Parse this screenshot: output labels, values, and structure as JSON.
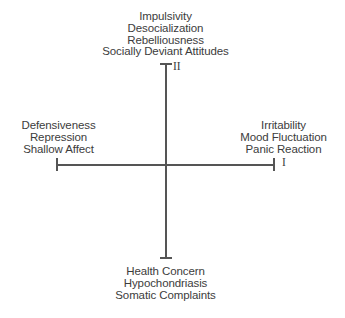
{
  "diagram": {
    "background_color": "#ffffff",
    "line_color": "#555555",
    "text_color": "#3c3c3c",
    "quadrant_labels": {
      "axis_i": "I",
      "axis_ii": "II"
    },
    "top": {
      "lines": [
        "Impulsivity",
        "Desocialization",
        "Rebelliousness",
        "Socially Deviant Attitudes"
      ]
    },
    "bottom": {
      "lines": [
        "Health Concern",
        "Hypochondriasis",
        "Somatic Complaints"
      ]
    },
    "left": {
      "lines": [
        "Defensiveness",
        "Repression",
        "Shallow Affect"
      ]
    },
    "right": {
      "lines": [
        "Irritability",
        "Mood Fluctuation",
        "Panic Reaction"
      ]
    }
  },
  "chart_data": {
    "type": "scatter",
    "title": "",
    "xlabel": "",
    "ylabel": "",
    "axes": [
      {
        "name": "I",
        "orientation": "horizontal",
        "negative_pole": [
          "Defensiveness",
          "Repression",
          "Shallow Affect"
        ],
        "positive_pole": [
          "Irritability",
          "Mood Fluctuation",
          "Panic Reaction"
        ]
      },
      {
        "name": "II",
        "orientation": "vertical",
        "positive_pole": [
          "Impulsivity",
          "Desocialization",
          "Rebelliousness",
          "Socially Deviant Attitudes"
        ],
        "negative_pole": [
          "Health Concern",
          "Hypochondriasis",
          "Somatic Complaints"
        ]
      }
    ],
    "grid": false,
    "legend": "none",
    "values": [],
    "categories": []
  }
}
